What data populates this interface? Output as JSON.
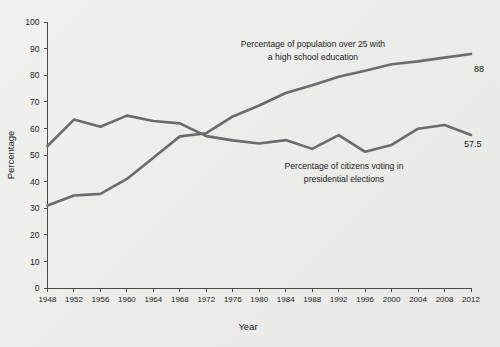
{
  "chart_data": {
    "type": "line",
    "title": "",
    "xlabel": "Year",
    "ylabel": "Percentage",
    "xlim": [
      1948,
      2012
    ],
    "ylim": [
      0,
      100
    ],
    "grid": false,
    "legend_position": "inline-annotations",
    "x": [
      1948,
      1952,
      1956,
      1960,
      1964,
      1968,
      1972,
      1976,
      1980,
      1984,
      1988,
      1992,
      1996,
      2000,
      2004,
      2008,
      2012
    ],
    "xtick_labels": [
      "1948",
      "1952",
      "1956",
      "1960",
      "1964",
      "1968",
      "1972",
      "1976",
      "1980",
      "1984",
      "1988",
      "1992",
      "1996",
      "2000",
      "2004",
      "2008",
      "2012"
    ],
    "ytick_labels": [
      "0",
      "10",
      "20",
      "30",
      "40",
      "50",
      "60",
      "70",
      "80",
      "90",
      "100"
    ],
    "ytick_values": [
      0,
      10,
      20,
      30,
      40,
      50,
      60,
      70,
      80,
      90,
      100
    ],
    "series": [
      {
        "name": "Percentage of population over 25 with a high school education",
        "values": [
          31,
          34.8,
          35.4,
          41,
          49,
          57,
          58.2,
          64.5,
          68.6,
          73.3,
          76.2,
          79.4,
          81.7,
          84.1,
          85.2,
          86.6,
          88
        ],
        "end_label": "88",
        "color": "#6b6b6b"
      },
      {
        "name": "Percentage of citizens voting in presidential elections",
        "values": [
          53.4,
          63.3,
          60.6,
          64.8,
          62.8,
          61.9,
          57.1,
          55.5,
          54.3,
          55.6,
          52.3,
          57.5,
          51.2,
          53.8,
          59.9,
          61.3,
          57.5
        ],
        "end_label": "57.5",
        "color": "#6b6b6b"
      }
    ],
    "annotations": [
      {
        "id": "education-annotation",
        "lines": [
          "Percentage of population over 25 with",
          "a high school education"
        ]
      },
      {
        "id": "voting-annotation",
        "lines": [
          "Percentage of citizens voting in",
          "presidential elections"
        ]
      }
    ]
  },
  "axes": {
    "y_title": "Percentage",
    "x_title": "Year"
  },
  "colors": {
    "line": "#6b6b6b",
    "axis": "#4a4a4a",
    "text": "#1b1b1b",
    "background": "#ededeb"
  }
}
